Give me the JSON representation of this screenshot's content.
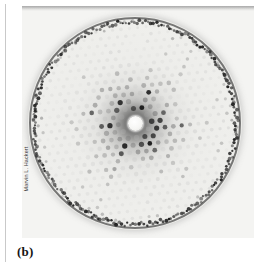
{
  "figure": {
    "panel_label": "(b)",
    "credit": "Marvin L. Hackert",
    "plate": {
      "background_color": "#f4f4f2",
      "rim_color": "#2d2d2d"
    }
  },
  "chart_data": {
    "type": "scatter",
    "title": "",
    "subtitle": "",
    "xlabel": "",
    "ylabel": "",
    "grid": false,
    "legend": null,
    "axis_ticks": [],
    "tick_labels": [],
    "annotations": [
      {
        "text": "(b)",
        "role": "panel-letter"
      },
      {
        "text": "Marvin L. Hackert",
        "role": "image-credit"
      }
    ],
    "geometry": {
      "center_x": 107,
      "center_y": 107,
      "disc_radius": 106,
      "beam_stop_radius": 7.5,
      "lattice": "hexagonal",
      "lattice_spacing_px": 8.4,
      "rings_visible": 13
    },
    "colors": {
      "plate": "#f4f4f2",
      "spot_dark": "#1a1a1a",
      "spot_mid": "#6e6e6e",
      "spot_faint": "#b8b8b8",
      "rim": "#2d2d2d",
      "beam_stop": "#ffffff",
      "rule": "#c9c9c9"
    },
    "intensity_profile": {
      "note": "Spot darkness as a function of radial distance r (px) from the beam centre.",
      "r": [
        10,
        20,
        30,
        40,
        50,
        60,
        70,
        80,
        90,
        100,
        106
      ],
      "opacity": [
        0.95,
        0.92,
        0.8,
        0.62,
        0.46,
        0.36,
        0.3,
        0.28,
        0.32,
        0.55,
        0.78
      ]
    }
  }
}
